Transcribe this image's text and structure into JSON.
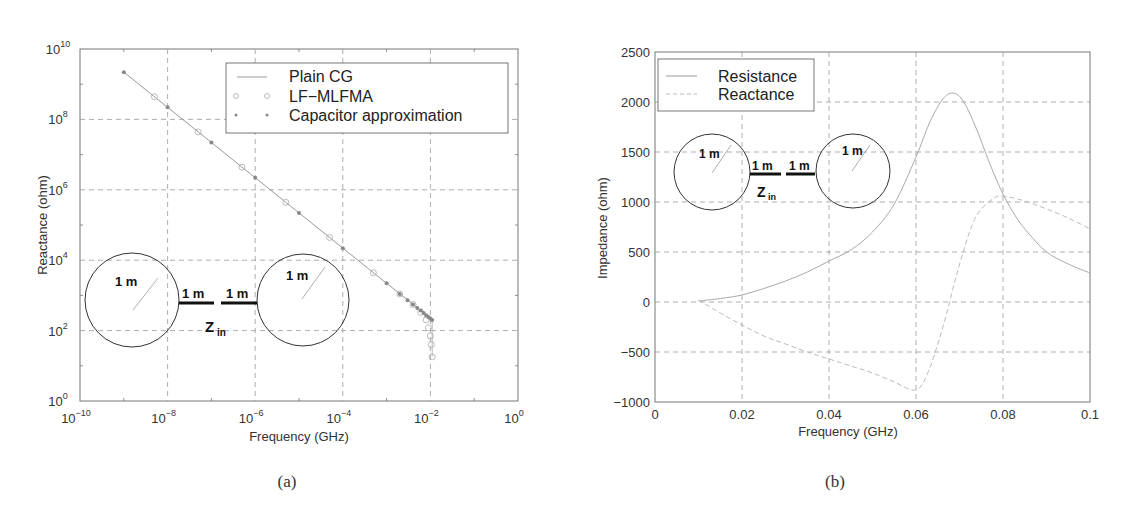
{
  "figure": {
    "captions": [
      "(a)",
      "(b)"
    ]
  },
  "chart_data": [
    {
      "type": "line",
      "panel": "(a)",
      "title": "",
      "xlabel": "Frequency (GHz)",
      "ylabel": "Reactance (ohm)",
      "xscale": "log",
      "yscale": "log",
      "xlim": [
        1e-10,
        1
      ],
      "ylim": [
        1,
        10000000000.0
      ],
      "x_ticks": [
        {
          "base": "10",
          "exp": "−10"
        },
        {
          "base": "10",
          "exp": "−8"
        },
        {
          "base": "10",
          "exp": "−6"
        },
        {
          "base": "10",
          "exp": "−4"
        },
        {
          "base": "10",
          "exp": "−2"
        },
        {
          "base": "10",
          "exp": "0"
        }
      ],
      "y_ticks": [
        {
          "base": "10",
          "exp": "0"
        },
        {
          "base": "10",
          "exp": "2"
        },
        {
          "base": "10",
          "exp": "4"
        },
        {
          "base": "10",
          "exp": "6"
        },
        {
          "base": "10",
          "exp": "8"
        },
        {
          "base": "10",
          "exp": "10"
        }
      ],
      "grid": true,
      "legend_position": "upper right",
      "series": [
        {
          "name": "Plain CG",
          "style": "solid line",
          "x": [
            1e-09,
            1e-08,
            1e-07,
            1e-06,
            1e-05,
            0.0001,
            0.001,
            0.003,
            0.006,
            0.01,
            0.011
          ],
          "y": [
            2200000000.0,
            220000000.0,
            22000000.0,
            2200000.0,
            220000.0,
            22000.0,
            2200.0,
            750,
            380,
            230,
            200
          ]
        },
        {
          "name": "LF−MLFMA",
          "style": "circle markers",
          "x": [
            5e-09,
            5e-08,
            5e-07,
            5e-06,
            5e-05,
            0.0005,
            0.002,
            0.004,
            0.006,
            0.008,
            0.009,
            0.01,
            0.0105,
            0.011
          ],
          "y": [
            440000000.0,
            44000000.0,
            4400000.0,
            440000.0,
            44000.0,
            4400.0,
            1100,
            550,
            330,
            200,
            120,
            70,
            40,
            18
          ]
        },
        {
          "name": "Capacitor approximation",
          "style": "star markers",
          "x": [
            1e-09,
            1e-08,
            1e-07,
            1e-06,
            1e-05,
            0.0001,
            0.001,
            0.002,
            0.003,
            0.004,
            0.005,
            0.006,
            0.007,
            0.008,
            0.009,
            0.01,
            0.011
          ],
          "y": [
            2200000000.0,
            220000000.0,
            22000000.0,
            2200000.0,
            220000.0,
            22000.0,
            2200.0,
            1100,
            730,
            550,
            440,
            370,
            315,
            275,
            245,
            220,
            200
          ]
        }
      ],
      "annotations": {
        "inset_diagram": {
          "sphere_radius_labels": [
            "1 m",
            "1 m"
          ],
          "wire_labels": [
            "1 m",
            "1 m"
          ],
          "port_label": {
            "main": "Z",
            "sub": "in"
          }
        }
      }
    },
    {
      "type": "line",
      "panel": "(b)",
      "title": "",
      "xlabel": "Frequency (GHz)",
      "ylabel": "Impedance (ohm)",
      "xlim": [
        0,
        0.1
      ],
      "ylim": [
        -1000,
        2500
      ],
      "x_ticks": [
        "0",
        "0.02",
        "0.04",
        "0.06",
        "0.08",
        "0.1"
      ],
      "y_ticks": [
        "−1000",
        "−500",
        "0",
        "500",
        "1000",
        "1500",
        "2000",
        "2500"
      ],
      "grid": true,
      "legend_position": "upper left",
      "series": [
        {
          "name": "Resistance",
          "style": "solid",
          "x": [
            0.01,
            0.015,
            0.02,
            0.025,
            0.03,
            0.035,
            0.04,
            0.045,
            0.05,
            0.055,
            0.06,
            0.063,
            0.066,
            0.0685,
            0.071,
            0.074,
            0.077,
            0.08,
            0.083,
            0.086,
            0.09,
            0.095,
            0.1
          ],
          "y": [
            10,
            35,
            70,
            135,
            210,
            300,
            410,
            520,
            700,
            980,
            1450,
            1780,
            2020,
            2090,
            2000,
            1720,
            1380,
            1080,
            850,
            680,
            500,
            380,
            290
          ]
        },
        {
          "name": "Reactance",
          "style": "dashed",
          "x": [
            0.01,
            0.015,
            0.02,
            0.025,
            0.03,
            0.035,
            0.04,
            0.045,
            0.05,
            0.055,
            0.059,
            0.061,
            0.063,
            0.065,
            0.067,
            0.069,
            0.071,
            0.073,
            0.075,
            0.078,
            0.08,
            0.085,
            0.09,
            0.095,
            0.1
          ],
          "y": [
            20,
            -110,
            -230,
            -340,
            -420,
            -500,
            -570,
            -640,
            -710,
            -800,
            -880,
            -850,
            -680,
            -420,
            -120,
            220,
            520,
            780,
            930,
            1040,
            1060,
            1010,
            930,
            840,
            730
          ]
        }
      ],
      "annotations": {
        "inset_diagram": {
          "sphere_radius_labels": [
            "1 m",
            "1 m"
          ],
          "wire_labels": [
            "1 m",
            "1 m"
          ],
          "port_label": {
            "main": "Z",
            "sub": "in"
          }
        }
      }
    }
  ]
}
